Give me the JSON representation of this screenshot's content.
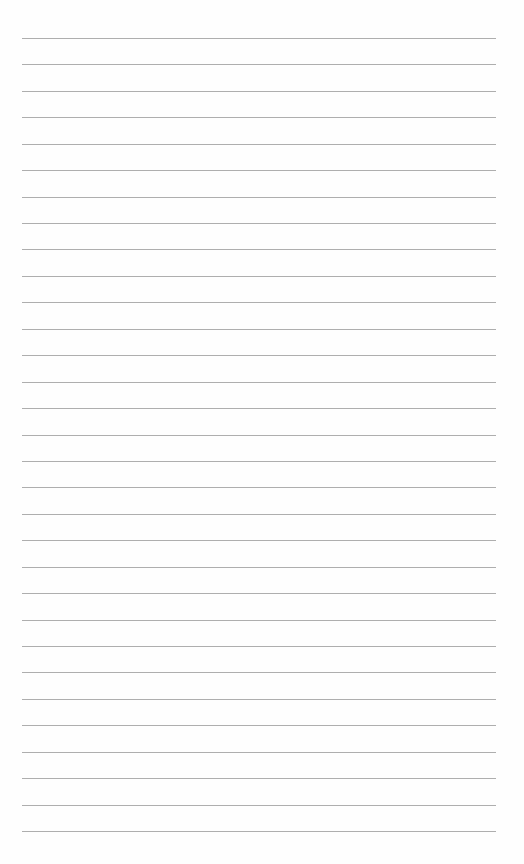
{
  "document": {
    "type": "lined-paper",
    "line_count": 31,
    "line_color": "#9a9a9a",
    "background_color": "#fefefe"
  }
}
